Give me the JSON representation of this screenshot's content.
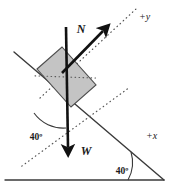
{
  "figure": {
    "type": "free-body-diagram",
    "background_color": "#ffffff"
  },
  "colors": {
    "block_fill": "#c4c4c4",
    "block_stroke": "#4d4d4d",
    "line": "#3a3a3a",
    "vector": "#111111",
    "dotted_axis": "#555555",
    "text": "#1a1a1a"
  },
  "vectors": [
    {
      "name": "normal-force",
      "label": "N",
      "label_x": 81,
      "label_y": 33,
      "from": {
        "x": 62,
        "y": 73
      },
      "to": {
        "x": 106,
        "y": 28
      }
    },
    {
      "name": "weight-force",
      "label": "W",
      "label_x": 85,
      "label_y": 155,
      "from": {
        "x": 66,
        "y": 27
      },
      "to": {
        "x": 68,
        "y": 153
      }
    }
  ],
  "axes": [
    {
      "name": "positive-y-axis",
      "label": "+y",
      "label_x": 139,
      "label_y": 19,
      "from": {
        "x": 44,
        "y": 94
      },
      "to": {
        "x": 134,
        "y": 10
      }
    },
    {
      "name": "positive-x-axis",
      "label": "+x",
      "label_x": 147,
      "label_y": 138,
      "from": {
        "x": 9,
        "y": 122
      },
      "to": {
        "x": 143,
        "y": 131
      }
    }
  ],
  "angles": [
    {
      "name": "incline-angle-at-block",
      "label": "40º",
      "label_x": 36,
      "label_y": 137
    },
    {
      "name": "incline-angle-at-ground",
      "label": "40º",
      "label_x": 122,
      "label_y": 172
    }
  ],
  "surfaces": {
    "incline": {
      "name": "incline-surface",
      "from": {
        "x": 14,
        "y": 52
      },
      "to": {
        "x": 164,
        "y": 180
      }
    },
    "ground": {
      "name": "ground-surface",
      "from": {
        "x": 5,
        "y": 180
      },
      "to": {
        "x": 164,
        "y": 180
      }
    }
  },
  "block": {
    "name": "block-on-incline",
    "points": "37,69 62,47 96,85 71,107"
  }
}
